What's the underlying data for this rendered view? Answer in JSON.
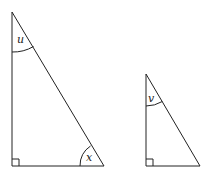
{
  "diagram": {
    "triangles": [
      {
        "id": "large",
        "vertices": {
          "top": [
            12,
            12
          ],
          "right_angle": [
            12,
            166
          ],
          "bottom_right": [
            104,
            166
          ]
        },
        "angle_labels": [
          {
            "label": "u",
            "at": "top"
          },
          {
            "label": "x",
            "at": "bottom_right"
          }
        ],
        "right_angle_marker": true
      },
      {
        "id": "small",
        "vertices": {
          "top": [
            146,
            74
          ],
          "right_angle": [
            146,
            166
          ],
          "bottom_right": [
            200,
            166
          ]
        },
        "angle_labels": [
          {
            "label": "v",
            "at": "top"
          }
        ],
        "right_angle_marker": true
      }
    ],
    "labels": {
      "u": "u",
      "x": "x",
      "v": "v"
    },
    "stroke_color": "#222222"
  }
}
